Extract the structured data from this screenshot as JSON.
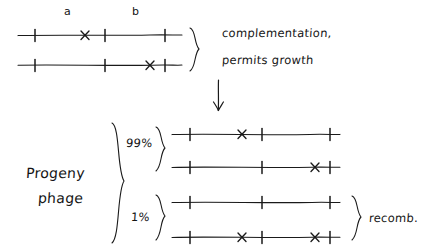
{
  "diagram": {
    "gene_labels": [
      {
        "text": "a",
        "x": 64,
        "y": 6
      },
      {
        "text": "b",
        "x": 132,
        "y": 6
      }
    ],
    "parental": {
      "caption_line1": "complementation,",
      "caption_line2": "permits growth",
      "lines": [
        {
          "name": "parent-a-mutant",
          "y": 35,
          "x1": 18,
          "x2": 182,
          "ticks": [
            35,
            105,
            165
          ],
          "xmarks": [
            85
          ]
        },
        {
          "name": "parent-b-mutant",
          "y": 65,
          "x1": 18,
          "x2": 182,
          "ticks": [
            35,
            105,
            165
          ],
          "xmarks": [
            150
          ]
        }
      ]
    },
    "arrow": {
      "name": "transition-arrow",
      "x": 218,
      "y1": 80,
      "y2": 110
    },
    "progeny": {
      "label_line1": "Progeny",
      "label_line2": "phage",
      "groups": [
        {
          "name": "parental-type-group",
          "percent": "99%",
          "lines": [
            {
              "name": "progeny-a-mutant",
              "y": 134,
              "x1": 172,
              "x2": 340,
              "ticks": [
                190,
                262,
                330
              ],
              "xmarks": [
                242
              ]
            },
            {
              "name": "progeny-b-mutant",
              "y": 167,
              "x1": 172,
              "x2": 340,
              "ticks": [
                190,
                262,
                330
              ],
              "xmarks": [
                315
              ]
            }
          ]
        },
        {
          "name": "recombinant-group",
          "percent": "1%",
          "side_label": "recomb.",
          "lines": [
            {
              "name": "progeny-wild-type",
              "y": 202,
              "x1": 172,
              "x2": 340,
              "ticks": [
                190,
                262,
                330
              ],
              "xmarks": []
            },
            {
              "name": "progeny-double-mutant",
              "y": 237,
              "x1": 172,
              "x2": 340,
              "ticks": [
                190,
                262,
                330
              ],
              "xmarks": [
                242,
                315
              ]
            }
          ]
        }
      ]
    },
    "colors": {
      "ink": "#1a1a1a",
      "background": "#ffffff"
    }
  }
}
